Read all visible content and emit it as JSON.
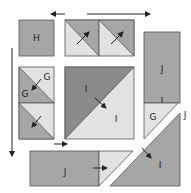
{
  "diagram": {
    "type": "quilt-block-assembly",
    "colors": {
      "dark": "#8a8a8a",
      "medium": "#a6a6a6",
      "light": "#e2e2e2",
      "outline": "#555555",
      "arrow": "#222222",
      "background": "#ffffff"
    },
    "pieces": {
      "h_square": {
        "label": "H"
      },
      "top_hst_1": {
        "label": ""
      },
      "top_hst_2": {
        "label": ""
      },
      "left_hst_top": {
        "label_a": "G",
        "label_b": "G"
      },
      "left_hst_bottom": {
        "label": ""
      },
      "center_square": {
        "label_a": "I",
        "label_b": "I"
      },
      "right_rect": {
        "label": "J"
      },
      "right_g_triangle": {
        "label": "G"
      },
      "seam_label": {
        "label": "J"
      },
      "bottom_rect": {
        "label": "J"
      },
      "bottom_right_triangle": {
        "label": "I"
      }
    },
    "arrows": {
      "top_left": "left",
      "top_right": "right",
      "left_vertical": "down",
      "middle_small": "right"
    }
  }
}
